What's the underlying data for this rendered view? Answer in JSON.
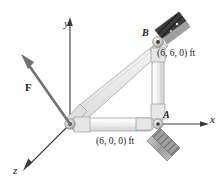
{
  "figure": {
    "type": "engineering-statics-diagram",
    "background_color": "#ffffff",
    "labels": {
      "axis_x": "x",
      "axis_y": "y",
      "axis_z": "z",
      "point_a": "A",
      "point_b": "B",
      "coord_a": "(6, 0, 0) ft",
      "coord_b": "(6, 6, 0) ft",
      "force": "F"
    },
    "colors": {
      "axis": "#3a3a3a",
      "member_fill": "#e9e9e9",
      "member_edge": "#9a9a9a",
      "member_highlight": "#f7f7f7",
      "joint": "#c9c9c9",
      "bracket_dark": "#4a4a4a",
      "bracket_light": "#b5b5b5",
      "force_arrow": "#6e6e6e",
      "text": "#1a1a1a"
    },
    "geometry": {
      "origin_px": [
        70,
        124
      ],
      "point_a_px": [
        158,
        124
      ],
      "point_b_px": [
        158,
        42
      ],
      "force_tip_px": [
        22,
        59
      ]
    }
  }
}
